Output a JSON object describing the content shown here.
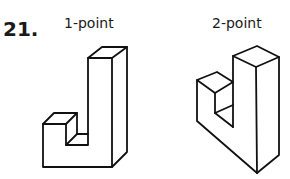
{
  "problem": {
    "number": "21.",
    "figures": [
      {
        "label": "1-point",
        "description": "L-shaped block drawn in one-point perspective"
      },
      {
        "label": "2-point",
        "description": "L-shaped block drawn in two-point perspective"
      }
    ]
  }
}
